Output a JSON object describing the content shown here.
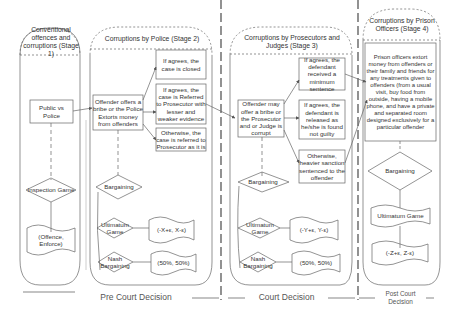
{
  "stage1": {
    "title": "Conventional offences and corruptions (Stage 1)",
    "box": "Public vs Police",
    "game": "Inspection Game",
    "payoff": "(Offence, Enforce)"
  },
  "stage2": {
    "title": "Corruptions by Police (Stage 2)",
    "action": "Offender offers a bribe or the Police Extorts money from offenders",
    "outcomes": [
      "If agrees, the case is closed",
      "If agrees, the case is Referred to Prosecutor with lesser and weaker evidence",
      "Otherwise, the case is referred to Prosecutor as it is"
    ],
    "bargaining": "Bargaining",
    "ultimatum": "Ultimatum Game",
    "ultimatum_payoff": "(-X+ε, X-ε)",
    "nash": "Nash Bargaining",
    "nash_payoff": "(50%, 50%)"
  },
  "stage3": {
    "title": "Corruptions by Prosecutors and Judges (Stage 3)",
    "action": "Offender may offer a bribe or the Prosecutor and or Judge is corrupt",
    "outcomes": [
      "If agrees, the defendant received a minimum sentence",
      "If agrees, the defendant is released as he/she is found not guilty",
      "Otherwise, heavier sanction sentenced to the offender"
    ],
    "bargaining": "Bargaining",
    "ultimatum": "Ultimatum Game",
    "ultimatum_payoff": "(-Y+ε, Y-ε)",
    "nash": "Nash Bargaining",
    "nash_payoff": "(50%, 50%)"
  },
  "stage4": {
    "title": "Corruptions by Prison Officers (Stage 4)",
    "action": "Prison officers extort money from offenders or their family and friends for any treatments given to offenders (from a usual visit, buy food from outside, having a mobile phone, and have a private and separated room designed exclusively for a particular offender",
    "bargaining": "Bargaining",
    "ultimatum": "Ultimatum Game",
    "ultimatum_payoff": "(-Z+ε, Z-ε)"
  },
  "phases": {
    "pre_court": "Pre Court Decision",
    "court": "Court Decision",
    "post_court": "Post Court Decision"
  }
}
